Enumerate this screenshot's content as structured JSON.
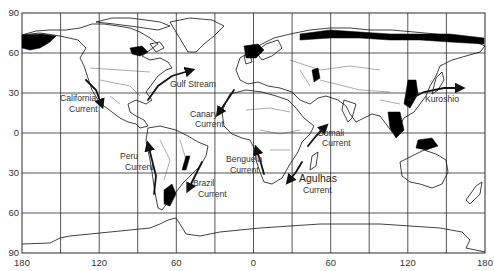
{
  "map": {
    "title": "",
    "projection": "equirectangular",
    "y_axis": {
      "tick_labels": [
        "90",
        "60",
        "30",
        "0",
        "30",
        "60",
        "90"
      ],
      "tick_values": [
        90,
        60,
        30,
        0,
        -30,
        -60,
        -90
      ]
    },
    "x_axis": {
      "tick_labels": [
        "180",
        "120",
        "60",
        "0",
        "60",
        "120",
        "180"
      ],
      "tick_values": [
        -180,
        -120,
        -60,
        0,
        60,
        120,
        180
      ]
    },
    "grid": {
      "spacing_degrees": 30,
      "visible": true
    },
    "currents": [
      {
        "name": "gulf-stream",
        "label_lines": [
          "Gulf Stream"
        ],
        "direction": "northeast",
        "lon": -75,
        "lat": 35
      },
      {
        "name": "california-current",
        "label_lines": [
          "California",
          "Current"
        ],
        "direction": "southeast",
        "lon": -125,
        "lat": 30
      },
      {
        "name": "canary-current",
        "label_lines": [
          "Canary",
          "Current"
        ],
        "direction": "southwest",
        "lon": -15,
        "lat": 25
      },
      {
        "name": "kuroshio",
        "label_lines": [
          "Kuroshio"
        ],
        "direction": "east",
        "lon": 145,
        "lat": 35
      },
      {
        "name": "somali-current",
        "label_lines": [
          "Somali",
          "Current"
        ],
        "direction": "northeast",
        "lon": 50,
        "lat": 5
      },
      {
        "name": "peru-current",
        "label_lines": [
          "Peru",
          "Current"
        ],
        "direction": "north",
        "lon": -78,
        "lat": -20
      },
      {
        "name": "brazil-current",
        "label_lines": [
          "Brazil",
          "Current"
        ],
        "direction": "southwest",
        "lon": -45,
        "lat": -30
      },
      {
        "name": "benguela-current",
        "label_lines": [
          "Benguela",
          "Current"
        ],
        "direction": "north",
        "lon": 12,
        "lat": -25
      },
      {
        "name": "agulhas-current",
        "label_lines": [
          "Agulhas",
          "Current"
        ],
        "direction": "southwest",
        "lon": 35,
        "lat": -30
      }
    ],
    "colors": {
      "land_outline": "#111111",
      "ice": "#000000",
      "grid": "#2a2a2a",
      "background": "#ffffff"
    }
  }
}
